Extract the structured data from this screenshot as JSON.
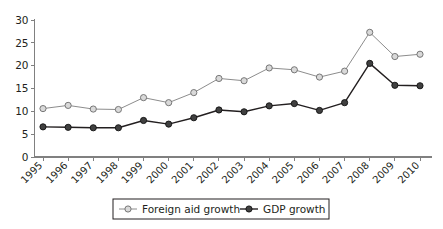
{
  "chart_data": {
    "type": "line",
    "title": "",
    "subtitle": "",
    "xlabel": "",
    "ylabel": "",
    "categories": [
      "1995",
      "1996",
      "1997",
      "1998",
      "1999",
      "2000",
      "2001",
      "2002",
      "2003",
      "2004",
      "2005",
      "2006",
      "2007",
      "2008",
      "2009",
      "2010"
    ],
    "x": [
      1995,
      1996,
      1997,
      1998,
      1999,
      2000,
      2001,
      2002,
      2003,
      2004,
      2005,
      2006,
      2007,
      2008,
      2009,
      2010
    ],
    "series": [
      {
        "name": "Foreign aid growth",
        "marker": "open-circle",
        "color": "#7f7f7f",
        "marker_fill": "#d9d9d9",
        "values": [
          10.6,
          11.3,
          10.5,
          10.4,
          13.0,
          11.9,
          14.1,
          17.2,
          16.7,
          19.5,
          19.1,
          17.5,
          18.8,
          27.3,
          22.0,
          22.5
        ]
      },
      {
        "name": "GDP growth",
        "marker": "filled-circle",
        "color": "#231f20",
        "marker_fill": "#404040",
        "values": [
          6.6,
          6.5,
          6.4,
          6.4,
          8.0,
          7.2,
          8.6,
          10.3,
          9.9,
          11.2,
          11.7,
          10.2,
          11.9,
          20.5,
          15.7,
          15.6
        ]
      }
    ],
    "ylim": [
      0,
      30
    ],
    "yticks": [
      0,
      5,
      10,
      15,
      20,
      25,
      30
    ],
    "ytick_labels": [
      "0",
      "5",
      "10",
      "15",
      "20",
      "25",
      "30"
    ],
    "grid": false,
    "legend_position": "bottom",
    "xtick_rotation_deg": -45
  },
  "legend": {
    "items": [
      {
        "label": "Foreign aid growth",
        "marker": "open-circle-marker"
      },
      {
        "label": "GDP growth",
        "marker": "filled-circle-marker"
      }
    ]
  },
  "colors": {
    "axis": "#808080",
    "text": "#231f20",
    "series_foreign_aid": "#7f7f7f",
    "series_gdp": "#231f20",
    "background": "#ffffff"
  }
}
